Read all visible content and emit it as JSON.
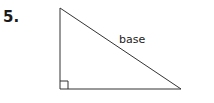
{
  "problem": {
    "number": "5.",
    "figure": {
      "shape": "right-triangle",
      "label": "base",
      "label_side": "hypotenuse",
      "right_angle_marker": true,
      "stroke_color": "#333333"
    }
  }
}
